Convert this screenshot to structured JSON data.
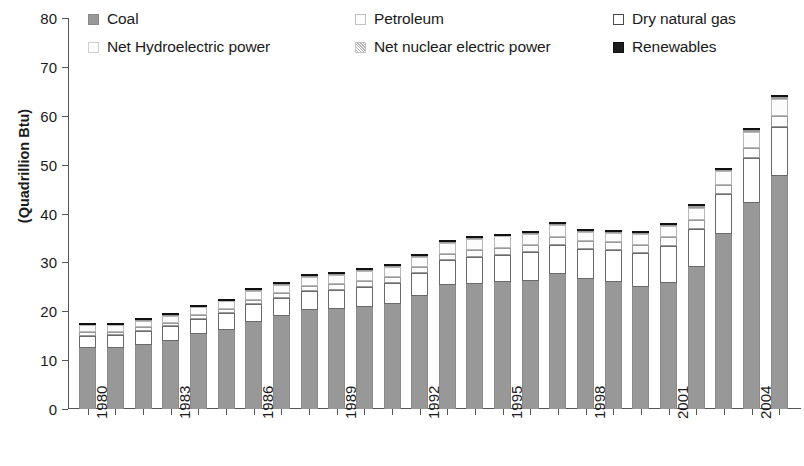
{
  "chart_data": {
    "type": "bar",
    "stacked": true,
    "title": "",
    "xlabel": "",
    "ylabel": "(Quadrillion Btu)",
    "ylim": [
      0,
      80
    ],
    "yticks": [
      0,
      10,
      20,
      30,
      40,
      50,
      60,
      70,
      80
    ],
    "grid": false,
    "legend_position": "top",
    "x": [
      1980,
      1981,
      1982,
      1983,
      1984,
      1985,
      1986,
      1987,
      1988,
      1989,
      1990,
      1991,
      1992,
      1993,
      1994,
      1995,
      1996,
      1997,
      1998,
      1999,
      2000,
      2001,
      2002,
      2003,
      2004,
      2005
    ],
    "xtick_labels": [
      "1980",
      "1983",
      "1986",
      "1989",
      "1992",
      "1995",
      "1998",
      "2001",
      "2004"
    ],
    "xtick_indices": [
      0,
      3,
      6,
      9,
      12,
      15,
      18,
      21,
      24
    ],
    "categories": [
      "1980",
      "1981",
      "1982",
      "1983",
      "1984",
      "1985",
      "1986",
      "1987",
      "1988",
      "1989",
      "1990",
      "1991",
      "1992",
      "1993",
      "1994",
      "1995",
      "1996",
      "1997",
      "1998",
      "1999",
      "2000",
      "2001",
      "2002",
      "2003",
      "2004",
      "2005"
    ],
    "series": [
      {
        "name": "Coal",
        "key": "coal",
        "color": "#989898",
        "values": [
          12.5,
          12.5,
          13.2,
          14.0,
          15.3,
          16.1,
          17.9,
          19.0,
          20.3,
          20.4,
          20.8,
          21.4,
          23.2,
          25.3,
          25.6,
          25.9,
          26.2,
          27.6,
          26.6,
          25.9,
          24.9,
          25.8,
          29.1,
          35.8,
          42.2,
          47.7
        ]
      },
      {
        "name": "Petroleum",
        "key": "petroleum",
        "color": "#fdfdfd",
        "values": [
          0.8,
          0.7,
          0.7,
          0.7,
          0.7,
          0.8,
          0.9,
          0.9,
          1.0,
          1.1,
          1.2,
          1.2,
          1.3,
          1.4,
          1.4,
          1.4,
          1.4,
          1.5,
          1.5,
          1.6,
          1.6,
          1.7,
          1.8,
          1.9,
          2.0,
          2.1
        ]
      },
      {
        "name": "Dry natural gas",
        "key": "natgas",
        "color": "#ffffff",
        "values": [
          2.5,
          2.6,
          2.8,
          2.9,
          3.2,
          3.5,
          3.6,
          3.8,
          3.9,
          4.0,
          4.2,
          4.4,
          4.6,
          5.1,
          5.5,
          5.7,
          5.9,
          6.0,
          6.2,
          6.6,
          7.1,
          7.6,
          7.7,
          8.1,
          9.2,
          10.1
        ]
      },
      {
        "name": "Net Hydroelectric power",
        "key": "hydro",
        "color": "#fcfcfc",
        "values": [
          1.3,
          1.3,
          1.4,
          1.5,
          1.6,
          1.6,
          1.7,
          1.7,
          1.8,
          1.9,
          2.0,
          2.0,
          2.1,
          2.1,
          2.2,
          2.3,
          2.4,
          2.5,
          2.0,
          2.0,
          2.2,
          2.4,
          2.6,
          2.8,
          3.2,
          3.5
        ]
      },
      {
        "name": "Net nuclear electric power",
        "key": "nuclear",
        "color": "#d8d8d8",
        "values": [
          0.1,
          0.1,
          0.1,
          0.1,
          0.1,
          0.1,
          0.2,
          0.2,
          0.2,
          0.2,
          0.2,
          0.2,
          0.2,
          0.2,
          0.2,
          0.2,
          0.2,
          0.2,
          0.2,
          0.2,
          0.2,
          0.2,
          0.3,
          0.3,
          0.4,
          0.5
        ]
      },
      {
        "name": "Renewables",
        "key": "renew",
        "color": "#1d1d1d",
        "values": [
          0.1,
          0.1,
          0.1,
          0.1,
          0.1,
          0.1,
          0.1,
          0.1,
          0.1,
          0.1,
          0.1,
          0.1,
          0.1,
          0.1,
          0.1,
          0.1,
          0.1,
          0.1,
          0.1,
          0.1,
          0.1,
          0.1,
          0.1,
          0.1,
          0.2,
          0.2
        ]
      }
    ],
    "totals": [
      17.3,
      17.3,
      18.3,
      19.3,
      21.0,
      22.2,
      24.4,
      25.7,
      27.3,
      27.7,
      28.5,
      29.3,
      31.5,
      34.2,
      35.0,
      35.6,
      36.2,
      37.9,
      36.6,
      36.4,
      36.1,
      37.8,
      41.6,
      49.0,
      57.2,
      64.1
    ]
  },
  "legend": {
    "items": [
      {
        "label": "Coal",
        "swatch": "coal-swatch",
        "row": 0,
        "col": 0
      },
      {
        "label": "Petroleum",
        "swatch": "petroleum-swatch",
        "row": 0,
        "col": 1
      },
      {
        "label": "Dry natural gas",
        "swatch": "natgas-swatch",
        "row": 0,
        "col": 2
      },
      {
        "label": "Net Hydroelectric power",
        "swatch": "hydro-swatch",
        "row": 1,
        "col": 0
      },
      {
        "label": "Net nuclear electric power",
        "swatch": "nuclear-swatch",
        "row": 1,
        "col": 1
      },
      {
        "label": "Renewables",
        "swatch": "renew-swatch",
        "row": 1,
        "col": 2
      }
    ]
  }
}
